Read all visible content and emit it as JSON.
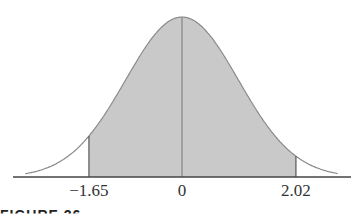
{
  "chart_data": {
    "type": "area",
    "title": "",
    "distribution": "standard normal",
    "shaded_region": {
      "from": -1.65,
      "to": 2.02
    },
    "center_line": 0,
    "x_ticks": [
      {
        "value": -1.65,
        "label": "−1.65"
      },
      {
        "value": 0,
        "label": "0"
      },
      {
        "value": 2.02,
        "label": "2.02"
      }
    ],
    "xlabel": "",
    "ylabel": "",
    "grid": false,
    "xlim": [
      -3.0,
      3.0
    ],
    "colors": {
      "fill": "#c8c8c8",
      "curve": "#8a8a8a",
      "axis": "#444444"
    }
  },
  "caption_partial": "FIGURE 26"
}
